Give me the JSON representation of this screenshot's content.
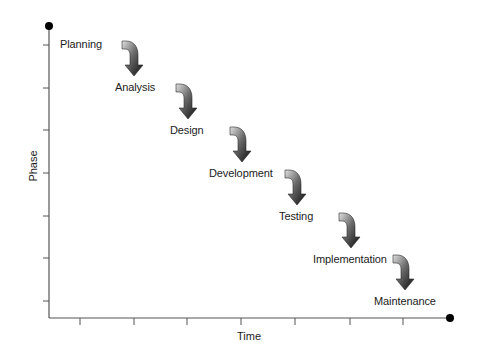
{
  "diagram": {
    "type": "waterfall",
    "y_axis_title": "Phase",
    "x_axis_title": "Time",
    "colors": {
      "axis": "#555555",
      "dot": "#000000",
      "arrow_light": "#d8d8d8",
      "arrow_dark": "#111111",
      "text": "#1c1c1c"
    },
    "phases": [
      {
        "label": "Planning",
        "x": 60,
        "y": 38
      },
      {
        "label": "Analysis",
        "x": 115,
        "y": 81
      },
      {
        "label": "Design",
        "x": 170,
        "y": 124
      },
      {
        "label": "Development",
        "x": 209,
        "y": 167
      },
      {
        "label": "Testing",
        "x": 279,
        "y": 210
      },
      {
        "label": "Implementation",
        "x": 313,
        "y": 253
      },
      {
        "label": "Maintenance",
        "x": 374,
        "y": 295
      }
    ],
    "arrows": [
      {
        "x": 122,
        "y": 41
      },
      {
        "x": 176,
        "y": 84
      },
      {
        "x": 230,
        "y": 127
      },
      {
        "x": 285,
        "y": 170
      },
      {
        "x": 339,
        "y": 213
      },
      {
        "x": 393,
        "y": 255
      }
    ],
    "y_ticks": [
      45,
      88,
      130,
      173,
      216,
      258,
      301
    ],
    "x_ticks": [
      80,
      134,
      187,
      241,
      295,
      350,
      403
    ]
  }
}
